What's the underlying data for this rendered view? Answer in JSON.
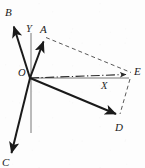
{
  "figure": {
    "type": "vector-diagram",
    "background_color": "#fdfdfd",
    "stroke_color": "#1a1a1a",
    "axis_color": "#555555",
    "width": 145,
    "height": 168
  },
  "origin": {
    "label": "O",
    "x": 30,
    "y": 78,
    "label_x": 19,
    "label_y": 70
  },
  "axes": [
    {
      "name": "y-axis",
      "label": "Y",
      "label_x": 27,
      "label_y": 25,
      "x1": 31,
      "y1": 33,
      "x2": 31,
      "y2": 133,
      "style": "solid-thin"
    },
    {
      "name": "x-axis",
      "label": "X",
      "label_x": 103,
      "label_y": 82,
      "x1": 30,
      "y1": 78,
      "x2": 128,
      "y2": 78,
      "style": "solid-thin"
    }
  ],
  "vectors": [
    {
      "name": "vector-A",
      "label": "A",
      "label_x": 40,
      "label_y": 25,
      "x1": 30,
      "y1": 78,
      "x2": 44,
      "y2": 40,
      "style": "solid-arrow"
    },
    {
      "name": "vector-B",
      "label": "B",
      "label_x": 5,
      "label_y": 8,
      "x1": 30,
      "y1": 78,
      "x2": 13,
      "y2": 24,
      "style": "solid-arrow"
    },
    {
      "name": "vector-C",
      "label": "C",
      "label_x": 3,
      "label_y": 158,
      "x1": 30,
      "y1": 78,
      "x2": 10,
      "y2": 156,
      "style": "solid-arrow"
    },
    {
      "name": "vector-D",
      "label": "D",
      "label_x": 116,
      "label_y": 124,
      "x1": 30,
      "y1": 78,
      "x2": 118,
      "y2": 116,
      "style": "solid-arrow"
    },
    {
      "name": "vector-E",
      "label": "E",
      "label_x": 133,
      "label_y": 69,
      "x1": 30,
      "y1": 78,
      "x2": 128,
      "y2": 74,
      "style": "dash-dot-arrow"
    }
  ],
  "construction_lines": [
    {
      "name": "dashed-A-to-E",
      "x1": 46,
      "y1": 38,
      "x2": 130,
      "y2": 73,
      "style": "dashed"
    },
    {
      "name": "dashed-E-to-D",
      "x1": 130,
      "y1": 78,
      "x2": 120,
      "y2": 114,
      "style": "dashed"
    }
  ],
  "labels": {
    "A": "A",
    "B": "B",
    "C": "C",
    "D": "D",
    "E": "E",
    "O": "O",
    "X": "X",
    "Y": "Y"
  }
}
